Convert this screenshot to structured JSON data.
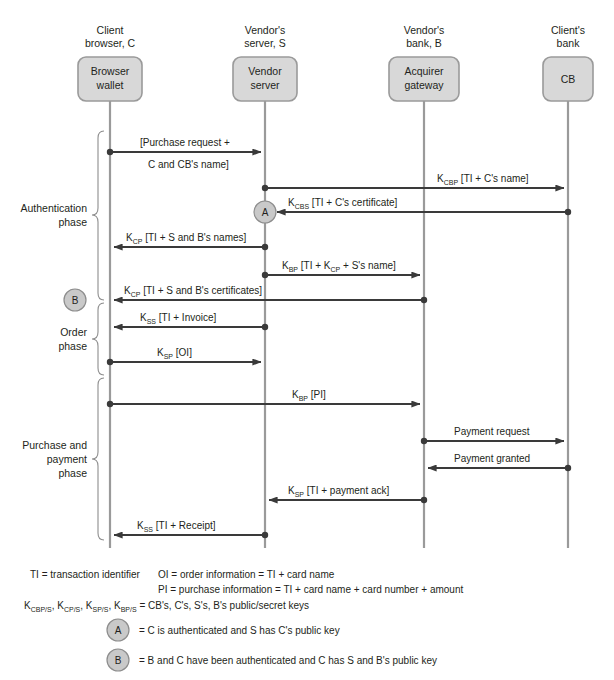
{
  "diagram": {
    "colors": {
      "box_fill": "#d8d8d8",
      "box_stroke": "#9a9a9a",
      "lifeline": "#9a9a9a",
      "arrow": "#3a3a3a",
      "marker_fill": "#c9c9c9",
      "text": "#231f20",
      "background": "#ffffff"
    },
    "actors": [
      {
        "id": "client",
        "header_line1": "Client",
        "header_line2": "browser, C",
        "box_line1": "Browser",
        "box_line2": "wallet",
        "x": 110
      },
      {
        "id": "server",
        "header_line1": "Vendor's",
        "header_line2": "server, S",
        "box_line1": "Vendor",
        "box_line2": "server",
        "x": 265
      },
      {
        "id": "bank",
        "header_line1": "Vendor's",
        "header_line2": "bank, B",
        "box_line1": "Acquirer",
        "box_line2": "gateway",
        "x": 424
      },
      {
        "id": "clientbank",
        "header_line1": "Client's",
        "header_line2": "bank",
        "box_line1": "CB",
        "box_line2": "",
        "x": 568
      }
    ],
    "phases": [
      {
        "id": "authentication",
        "label_line1": "Authentication",
        "label_line2": "phase",
        "label_line3": "",
        "y_top": 131,
        "y_bottom": 300
      },
      {
        "id": "order",
        "label_line1": "Order",
        "label_line2": "phase",
        "label_line3": "",
        "y_top": 303,
        "y_bottom": 375
      },
      {
        "id": "purchase",
        "label_line1": "Purchase and",
        "label_line2": "payment",
        "label_line3": "phase",
        "y_top": 378,
        "y_bottom": 540
      }
    ],
    "messages": [
      {
        "id": "m1",
        "from": "client",
        "to": "server",
        "y": 152,
        "label_above": "[Purchase request +",
        "label_below": "C and CB's name]",
        "label": "",
        "sub": ""
      },
      {
        "id": "m2",
        "from": "server",
        "to": "clientbank",
        "y": 188,
        "label": "K",
        "sub": "CBP",
        "rest": " [TI + C's name]"
      },
      {
        "id": "m3",
        "from": "clientbank",
        "to": "server",
        "y": 212,
        "label": "K",
        "sub": "CBS",
        "rest": " [TI + C's certificate]"
      },
      {
        "id": "m4",
        "from": "server",
        "to": "client",
        "y": 247,
        "label": "K",
        "sub": "CP",
        "rest": " [TI + S and B's names]"
      },
      {
        "id": "m5",
        "from": "server",
        "to": "bank",
        "y": 275,
        "label": "K",
        "sub": "BP",
        "rest": " [TI + K",
        "sub2": "CP",
        "rest2": " + S's name]"
      },
      {
        "id": "m6",
        "from": "bank",
        "to": "client",
        "y": 300,
        "label": "K",
        "sub": "CP",
        "rest": " [TI + S and B's certificates]"
      },
      {
        "id": "m7",
        "from": "server",
        "to": "client",
        "y": 327,
        "label": "K",
        "sub": "SS",
        "rest": " [TI + Invoice]"
      },
      {
        "id": "m8",
        "from": "client",
        "to": "server",
        "y": 362,
        "label": "K",
        "sub": "SP",
        "rest": " [OI]"
      },
      {
        "id": "m9",
        "from": "client",
        "to": "bank",
        "y": 404,
        "label": "K",
        "sub": "BP",
        "rest": " [PI]"
      },
      {
        "id": "m10",
        "from": "bank",
        "to": "clientbank",
        "y": 441,
        "label": "Payment request",
        "sub": ""
      },
      {
        "id": "m11",
        "from": "clientbank",
        "to": "bank",
        "y": 468,
        "label": "Payment granted",
        "sub": ""
      },
      {
        "id": "m12",
        "from": "bank",
        "to": "server",
        "y": 500,
        "label": "K",
        "sub": "SP",
        "rest": " [TI + payment ack]"
      },
      {
        "id": "m13",
        "from": "server",
        "to": "client",
        "y": 535,
        "label": "K",
        "sub": "SS",
        "rest": " [TI + Receipt]"
      }
    ],
    "state_markers": [
      {
        "id": "marker-a",
        "letter": "A",
        "x": 265,
        "y": 212
      },
      {
        "id": "marker-b",
        "letter": "B",
        "x": 75,
        "y": 300
      }
    ],
    "legend": {
      "ti": "TI = transaction identifier",
      "oi": "OI = order information = TI + card name",
      "pi": "PI = purchase information = TI + card name + card number + amount",
      "keys_prefix": "K",
      "keys_line": "K_CBP/S, K_CP/S, K_SP/S, K_BP/S = CB's, C's, S's, B's public/secret keys",
      "keys_tail": " = CB's, C's, S's, B's public/secret keys",
      "keys_terms": [
        {
          "base": "K",
          "sub": "CBP/S"
        },
        {
          "base": "K",
          "sub": "CP/S"
        },
        {
          "base": "K",
          "sub": "SP/S"
        },
        {
          "base": "K",
          "sub": "BP/S"
        }
      ],
      "marker_a": "= C is authenticated and S has C's public key",
      "marker_b": "= B and C have been authenticated and C has S and B's public key",
      "marker_a_letter": "A",
      "marker_b_letter": "B"
    }
  }
}
